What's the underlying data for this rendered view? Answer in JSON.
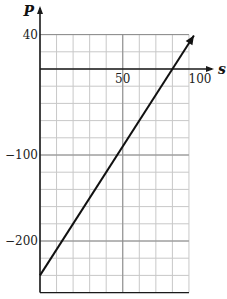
{
  "chart_data": {
    "type": "line",
    "title": "",
    "xlabel": "s",
    "ylabel": "P",
    "xlim": [
      0,
      90
    ],
    "ylim": [
      -260,
      40
    ],
    "x_ticks": [
      50,
      100
    ],
    "y_ticks": [
      40,
      -100,
      -200
    ],
    "x_tick_labels": [
      "50",
      "100"
    ],
    "y_tick_labels": [
      "40",
      "−100",
      "−200"
    ],
    "grid": true,
    "grid_step_x": 10,
    "grid_step_y": 20,
    "series": [
      {
        "name": "P",
        "x": [
          0,
          93
        ],
        "y": [
          -240,
          39
        ],
        "equation": "P = 3s - 240",
        "arrow_at_end": true
      }
    ],
    "legend": null
  },
  "colors": {
    "grid": "#c8c8c8",
    "axis": "#1a1a1a",
    "line": "#111111"
  }
}
